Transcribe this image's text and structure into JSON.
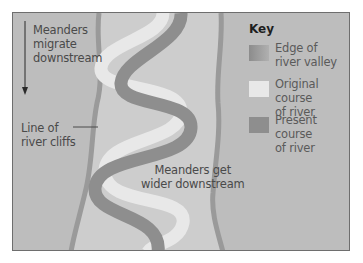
{
  "diagram": {
    "type": "river meanders plan view",
    "colors": {
      "background": "#bdbdbd",
      "valley_floor": "#cdcdcd",
      "valley_edge": "#9a9a9a",
      "original_course": "#e8e8e8",
      "present_course": "#8e8e8e",
      "text": "#4a4a4a",
      "frame": "#6e6e6e"
    },
    "annotations": {
      "migrate": [
        "Meanders",
        "migrate",
        "downstream"
      ],
      "cliffs": [
        "Line of",
        "river cliffs"
      ],
      "wider": [
        "Meanders get",
        "wider downstream"
      ]
    },
    "key": {
      "title": "Key",
      "items": [
        {
          "label_lines": [
            "Edge of",
            "river valley"
          ],
          "color": "#a0a0a0"
        },
        {
          "label_lines": [
            "Original course",
            "of river"
          ],
          "color": "#e8e8e8"
        },
        {
          "label_lines": [
            "Present course",
            "of river"
          ],
          "color": "#8e8e8e"
        }
      ]
    }
  }
}
